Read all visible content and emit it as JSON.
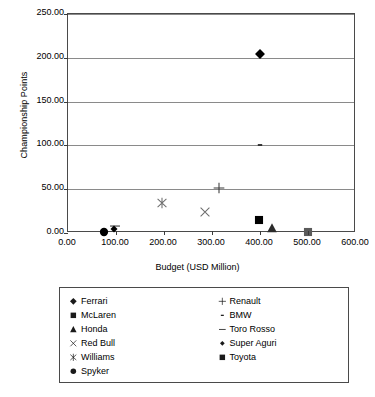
{
  "chart_data": {
    "type": "scatter",
    "title": "",
    "xlabel": "Budget (USD Million)",
    "ylabel": "Championship Points",
    "xlim": [
      0,
      600
    ],
    "ylim": [
      0,
      250
    ],
    "xticks": [
      "0.00",
      "100.00",
      "200.00",
      "300.00",
      "400.00",
      "500.00",
      "600.00"
    ],
    "xtick_values": [
      0,
      100,
      200,
      300,
      400,
      500,
      600
    ],
    "yticks": [
      "0.00",
      "50.00",
      "100.00",
      "150.00",
      "200.00",
      "250.00"
    ],
    "ytick_values": [
      0,
      50,
      100,
      150,
      200,
      250
    ],
    "grid": "horizontal",
    "legend_position": "below",
    "series": [
      {
        "name": "Ferrari",
        "marker": "diamond",
        "color": "#000000",
        "x": 400,
        "y": 204
      },
      {
        "name": "McLaren",
        "marker": "square",
        "color": "#000000",
        "x": 398,
        "y": 15
      },
      {
        "name": "Honda",
        "marker": "triangle",
        "color": "#2b2b2b",
        "x": 425,
        "y": 6
      },
      {
        "name": "Red Bull",
        "marker": "cross-x",
        "color": "#6e6e6e",
        "x": 285,
        "y": 24
      },
      {
        "name": "Williams",
        "marker": "star",
        "color": "#6e6e6e",
        "x": 196,
        "y": 34
      },
      {
        "name": "Spyker",
        "marker": "circle",
        "color": "#000000",
        "x": 75,
        "y": 1
      },
      {
        "name": "Renault",
        "marker": "plus",
        "color": "#3a3a3a",
        "x": 315,
        "y": 51
      },
      {
        "name": "BMW",
        "marker": "dash-short",
        "color": "#2b2b2b",
        "x": 400,
        "y": 101
      },
      {
        "name": "Toro Rosso",
        "marker": "dash-long",
        "color": "#4a4a4a",
        "x": 97,
        "y": 8
      },
      {
        "name": "Super Aguri",
        "marker": "diamond-small",
        "color": "#000000",
        "x": 95,
        "y": 4
      },
      {
        "name": "Toyota",
        "marker": "square-gray",
        "color": "#5a5a5a",
        "x": 500,
        "y": 1
      }
    ],
    "legend": {
      "left_column": [
        {
          "label": "Ferrari",
          "marker": "diamond"
        },
        {
          "label": "McLaren",
          "marker": "square"
        },
        {
          "label": "Honda",
          "marker": "triangle"
        },
        {
          "label": "Red Bull",
          "marker": "cross-x"
        },
        {
          "label": "Williams",
          "marker": "star"
        },
        {
          "label": "Spyker",
          "marker": "circle"
        }
      ],
      "right_column": [
        {
          "label": "Renault",
          "marker": "plus"
        },
        {
          "label": "BMW",
          "marker": "dash-short"
        },
        {
          "label": "Toro Rosso",
          "marker": "dash-long"
        },
        {
          "label": "Super Aguri",
          "marker": "diamond-small"
        },
        {
          "label": "Toyota",
          "marker": "square-gray"
        }
      ]
    }
  }
}
